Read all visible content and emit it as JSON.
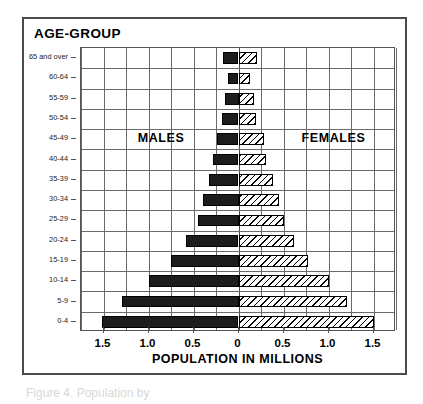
{
  "chart_title": "AGE-GROUP",
  "axis": {
    "x_title": "POPULATION IN MILLIONS",
    "x_ticks": [
      "1.5",
      "1.0",
      "0.5",
      "0",
      "0.5",
      "1.0",
      "1.5"
    ]
  },
  "series_labels": {
    "male": "MALES",
    "female": "FEMALES"
  },
  "caption_sliver": "Figure 4. Population by",
  "colors": {
    "male_fill": "#1c1c1c",
    "female_fill": "#ffffff",
    "hatch": "#000000",
    "grid": "#6b6b6b",
    "frame": "#4a4a4a"
  },
  "chart_data": {
    "type": "bar",
    "subtype": "population-pyramid",
    "title": "AGE-GROUP",
    "xlabel": "POPULATION IN MILLIONS",
    "ylabel": "AGE-GROUP",
    "xlim": [
      -1.75,
      1.75
    ],
    "x_tick_values": [
      -1.5,
      -1.0,
      -0.5,
      0,
      0.5,
      1.0,
      1.5
    ],
    "x_tick_labels": [
      "1.5",
      "1.0",
      "0.5",
      "0",
      "0.5",
      "1.0",
      "1.5"
    ],
    "grid": true,
    "legend": "in-plot text labels",
    "orientation": "horizontal",
    "categories": [
      "65 and over",
      "60-64",
      "55-59",
      "50-54",
      "45-49",
      "40-44",
      "35-39",
      "30-34",
      "25-29",
      "20-24",
      "15-19",
      "10-14",
      "5-9",
      "0-4"
    ],
    "series": [
      {
        "name": "MALES",
        "direction": "left",
        "values": [
          0.17,
          0.12,
          0.15,
          0.18,
          0.24,
          0.28,
          0.33,
          0.4,
          0.45,
          0.58,
          0.75,
          1.0,
          1.3,
          1.52
        ]
      },
      {
        "name": "FEMALES",
        "direction": "right",
        "values": [
          0.21,
          0.13,
          0.17,
          0.19,
          0.28,
          0.31,
          0.38,
          0.45,
          0.51,
          0.62,
          0.77,
          1.0,
          1.21,
          1.51
        ]
      }
    ]
  }
}
